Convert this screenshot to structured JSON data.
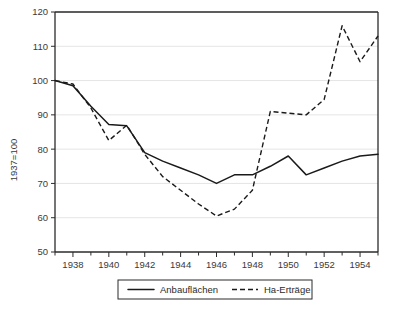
{
  "chart_data": {
    "type": "line",
    "title": "",
    "subtitle": "",
    "xlabel": "",
    "ylabel": "1937=100",
    "x": [
      1937,
      1938,
      1939,
      1940,
      1941,
      1942,
      1943,
      1944,
      1945,
      1946,
      1947,
      1948,
      1949,
      1950,
      1951,
      1952,
      1953,
      1954,
      1955
    ],
    "xlim": [
      1937,
      1955
    ],
    "ylim": [
      50,
      120
    ],
    "y_ticks": [
      50,
      60,
      70,
      80,
      90,
      100,
      110,
      120
    ],
    "y_tick_labels": [
      "50",
      "60",
      "70",
      "80",
      "90",
      "100",
      "110",
      "120"
    ],
    "x_ticks": [
      1937,
      1938,
      1939,
      1940,
      1941,
      1942,
      1943,
      1944,
      1945,
      1946,
      1947,
      1948,
      1949,
      1950,
      1951,
      1952,
      1953,
      1954,
      1955
    ],
    "x_tick_labels": [
      "",
      "1938",
      "",
      "1940",
      "",
      "1942",
      "",
      "1944",
      "",
      "1946",
      "",
      "1948",
      "",
      "1950",
      "",
      "1952",
      "",
      "1954",
      ""
    ],
    "grid": true,
    "grid_axis": "y",
    "legend_position": "bottom-center",
    "series": [
      {
        "name": "Anbauflächen",
        "style": "solid",
        "color": "#1a1a1a",
        "values": [
          100,
          98.5,
          92.5,
          87.2,
          86.8,
          79.0,
          76.5,
          74.5,
          72.5,
          70.0,
          72.5,
          72.5,
          75.0,
          78.0,
          72.5,
          74.5,
          76.5,
          78.0,
          78.5
        ]
      },
      {
        "name": "Ha-Erträge",
        "style": "dashed",
        "color": "#1a1a1a",
        "values": [
          100,
          99.0,
          92.0,
          82.5,
          87.0,
          78.5,
          72.0,
          68.0,
          64.0,
          60.5,
          62.5,
          68.0,
          91.0,
          90.5,
          90.0,
          94.5,
          116.0,
          105.5,
          113.0
        ]
      }
    ]
  },
  "legend": {
    "entries": [
      {
        "label": "Anbauflächen",
        "style": "solid"
      },
      {
        "label": "Ha-Erträge",
        "style": "dashed"
      }
    ]
  },
  "axis": {
    "y_title": "1937=100"
  }
}
